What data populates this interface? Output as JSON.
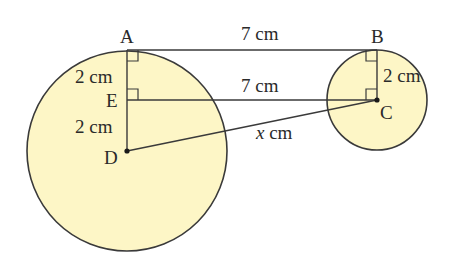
{
  "diagram": {
    "colors": {
      "fill": "#fdf6c6",
      "stroke": "#3a3a3a",
      "text": "#2a2a2a",
      "background": "#ffffff"
    },
    "points": {
      "A": {
        "label": "A",
        "x": 127,
        "y": 50
      },
      "B": {
        "label": "B",
        "x": 377,
        "y": 50
      },
      "C": {
        "label": "C",
        "x": 377,
        "y": 100
      },
      "D": {
        "label": "D",
        "x": 127,
        "y": 151
      },
      "E": {
        "label": "E",
        "x": 127,
        "y": 100
      }
    },
    "circles": [
      {
        "name": "large-circle",
        "center": "D",
        "r": 100
      },
      {
        "name": "small-circle",
        "center": "C",
        "r": 50
      }
    ],
    "segments": [
      {
        "from": "A",
        "to": "B",
        "label": "7 cm"
      },
      {
        "from": "E",
        "to": "C",
        "label": "7 cm"
      },
      {
        "from": "A",
        "to": "E",
        "label": "2 cm"
      },
      {
        "from": "E",
        "to": "D",
        "label": "2 cm"
      },
      {
        "from": "B",
        "to": "C",
        "label": "2 cm"
      },
      {
        "from": "D",
        "to": "C",
        "label_var": "x",
        "label_unit": " cm"
      }
    ],
    "right_angles": [
      "A",
      "E",
      "B",
      "C"
    ],
    "labels": {
      "ab": "7 cm",
      "ec": "7 cm",
      "ae": "2 cm",
      "ed": "2 cm",
      "bc": "2 cm",
      "dc_var": "x",
      "dc_unit": " cm"
    }
  }
}
